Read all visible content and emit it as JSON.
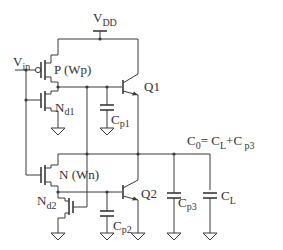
{
  "labels": {
    "vdd": {
      "main": "V",
      "sub": "DD"
    },
    "vin": {
      "main": "V",
      "sub": "in"
    },
    "p_transistor": "P  (Wp)",
    "n_transistor": "N (Wn)",
    "nd1": {
      "main": "N",
      "sub": "d1"
    },
    "nd2": {
      "main": "N",
      "sub": "d2"
    },
    "q1": "Q1",
    "q2": "Q2",
    "cp1": {
      "main": "C",
      "sub": "p1"
    },
    "cp2": {
      "main": "C",
      "sub": "p2"
    },
    "cp3": {
      "main": "C",
      "sub": "p3"
    },
    "cl": {
      "main": "C",
      "sub": "L"
    },
    "equation": {
      "lhs_main": "C",
      "lhs_sub": "0",
      "eq": "= ",
      "t1_main": "C",
      "t1_sub": "L",
      "plus": "+",
      "t2_main": "C",
      "t2_sub": " p3"
    }
  },
  "colors": {
    "wire": "#3a3a3a",
    "text": "#333333",
    "background": "#ffffff"
  }
}
